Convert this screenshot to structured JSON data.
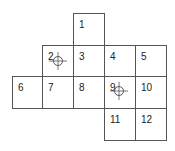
{
  "grid": {
    "line_color": "#555555",
    "cells": [
      {
        "label": "1",
        "col": 2,
        "row": 0,
        "marker": false
      },
      {
        "label": "2",
        "col": 1,
        "row": 1,
        "marker": true
      },
      {
        "label": "3",
        "col": 2,
        "row": 1,
        "marker": false
      },
      {
        "label": "4",
        "col": 3,
        "row": 1,
        "marker": false
      },
      {
        "label": "5",
        "col": 4,
        "row": 1,
        "marker": false
      },
      {
        "label": "6",
        "col": 0,
        "row": 2,
        "marker": false
      },
      {
        "label": "7",
        "col": 1,
        "row": 2,
        "marker": false
      },
      {
        "label": "8",
        "col": 2,
        "row": 2,
        "marker": false
      },
      {
        "label": "9",
        "col": 3,
        "row": 2,
        "marker": true
      },
      {
        "label": "10",
        "col": 4,
        "row": 2,
        "marker": false
      },
      {
        "label": "11",
        "col": 3,
        "row": 3,
        "marker": false
      },
      {
        "label": "12",
        "col": 4,
        "row": 3,
        "marker": false
      }
    ]
  },
  "markers": {
    "icon": "crosshair-icon",
    "color": "#555555"
  }
}
